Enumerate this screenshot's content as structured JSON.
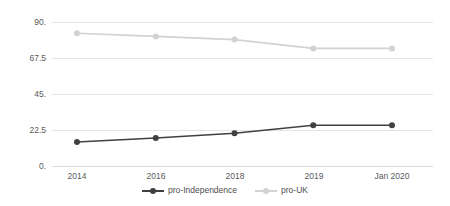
{
  "chart_data": {
    "type": "line",
    "title": "",
    "subtitle": "",
    "xlabel": "",
    "ylabel": "",
    "categories": [
      "2014",
      "2016",
      "2018",
      "2019",
      "Jan 2020"
    ],
    "series": [
      {
        "name": "pro-Independence",
        "color": "#404040",
        "marker": "circle",
        "values": [
          15,
          17.5,
          20.5,
          25.5,
          25.5
        ]
      },
      {
        "name": "pro-UK",
        "color": "#d2d2d2",
        "marker": "circle",
        "values": [
          83,
          81,
          79,
          73.5,
          73.5
        ]
      }
    ],
    "ylim": [
      0,
      90
    ],
    "yticks": [
      0,
      22.5,
      45,
      67.5,
      90
    ],
    "ytick_labels": [
      "0.",
      "22.5",
      "45.",
      "67.5",
      "90."
    ],
    "grid": "horizontal",
    "legend_position": "bottom"
  },
  "axes": {
    "y_tick_labels": [
      "90.",
      "67.5",
      "45.",
      "22.5",
      "0."
    ],
    "x_tick_labels": [
      "2014",
      "2016",
      "2018",
      "2019",
      "Jan 2020"
    ]
  },
  "legend": {
    "items": [
      {
        "label": "pro-Independence",
        "color": "#404040"
      },
      {
        "label": "pro-UK",
        "color": "#d2d2d2"
      }
    ]
  },
  "colors": {
    "pro_independence": "#404040",
    "pro_uk": "#d2d2d2",
    "gridline": "#e4e4e4",
    "text": "#5a5a5a",
    "background": "#ffffff"
  }
}
